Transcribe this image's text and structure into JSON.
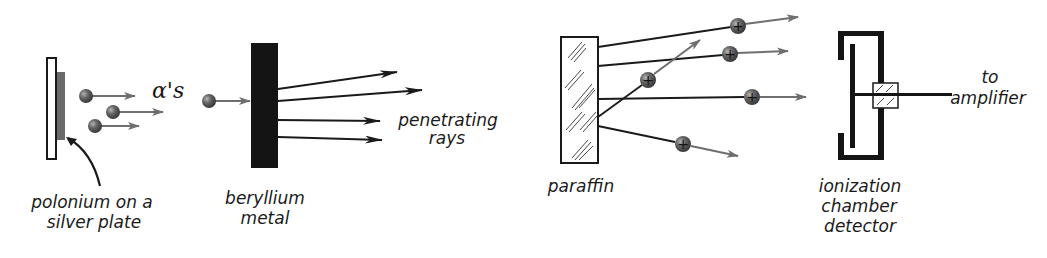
{
  "diagram": {
    "colors": {
      "ink": "#1a1a1a",
      "particle_arrow": "#6e6e6e",
      "particle_fill": "#5a5a5a",
      "polonium": "#6a6a6a"
    },
    "source": {
      "label_line1": "polonium on a",
      "label_line2": "silver plate"
    },
    "alpha": {
      "label": "α's"
    },
    "beryllium": {
      "label_line1": "beryllium",
      "label_line2": "metal"
    },
    "rays": {
      "label_line1": "penetrating",
      "label_line2": "rays"
    },
    "paraffin": {
      "label": "paraffin",
      "proton_symbol": "+"
    },
    "detector": {
      "label_line1": "ionization",
      "label_line2": "chamber",
      "label_line3": "detector",
      "output_line1": "to",
      "output_line2": "amplifier"
    }
  }
}
